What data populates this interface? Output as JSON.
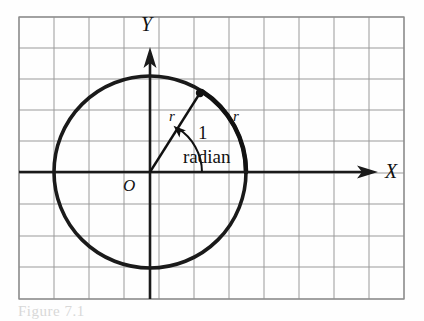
{
  "figure": {
    "caption_partial": "Figure 7.1",
    "colors": {
      "grid_line": "#9a9a9a",
      "grid_faint": "#cfcfcf",
      "frame": "#8c8c8c",
      "axis": "#1a1a1a",
      "circle": "#1a1a1a",
      "ink": "#111111",
      "background": "#fefefe"
    },
    "grid": {
      "columns": 11,
      "rows": 9,
      "cell_width": 35,
      "cell_height": 31.3,
      "left": 19,
      "top": 17,
      "right": 404,
      "bottom": 299
    },
    "axes": {
      "x_label": "X",
      "y_label": "Y",
      "origin_label": "O",
      "origin_x": 150,
      "origin_y": 172,
      "x_arrow_end": 378,
      "y_arrow_end": 47
    },
    "circle": {
      "center_x": 150,
      "center_y": 172,
      "radius": 96
    },
    "labels": {
      "radius_left": "r",
      "radius_arc": "r",
      "angle_value": "1",
      "angle_unit": "radian"
    },
    "point": {
      "x": 200,
      "y": 93,
      "radius": 4
    },
    "arc_angle_degrees": 57.2958
  }
}
